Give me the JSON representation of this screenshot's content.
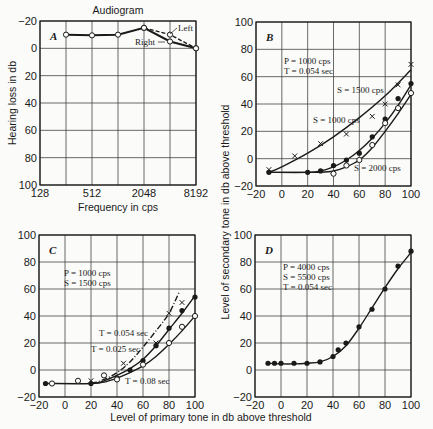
{
  "figure": {
    "shared_ylabel": "Level of secondary tone in db above threshold",
    "shared_xlabel": "Level of primary tone in db above threshold"
  },
  "chart_data": [
    {
      "id": "A",
      "type": "line",
      "title": "Audiogram",
      "panel_label": "A",
      "xlabel": "Frequency in cps",
      "ylabel": "Hearing loss in db",
      "x_scale": "log2",
      "x_ticks": [
        128,
        512,
        2048,
        8192
      ],
      "x_tick_labels": [
        "128",
        "512",
        "2048",
        "8192"
      ],
      "x_grid": [
        128,
        256,
        512,
        1024,
        2048,
        4096,
        8192
      ],
      "ylim": [
        -20,
        100
      ],
      "y_inverted": true,
      "y_ticks": [
        -20,
        0,
        20,
        40,
        60,
        80,
        100
      ],
      "y_tick_labels": [
        "−20",
        "0",
        "20",
        "40",
        "60",
        "80",
        "100"
      ],
      "grid": true,
      "series": [
        {
          "name": "Right",
          "style": "solid",
          "marker": "open-circle",
          "x": [
            256,
            512,
            1024,
            2048,
            4096,
            8192
          ],
          "y": [
            -10,
            -9.5,
            -10,
            -15,
            -5,
            0
          ]
        },
        {
          "name": "Left",
          "style": "dashed",
          "marker": "open-circle",
          "x": [
            2048,
            4096,
            8192
          ],
          "y": [
            -15,
            -10,
            0
          ]
        }
      ],
      "annotations": [
        {
          "text": "Left"
        },
        {
          "text": "Right"
        }
      ]
    },
    {
      "id": "B",
      "type": "scatter+line",
      "panel_label": "B",
      "xlim": [
        -20,
        100
      ],
      "ylim": [
        -20,
        100
      ],
      "x_ticks": [
        -20,
        0,
        20,
        40,
        60,
        80,
        100
      ],
      "y_ticks": [
        -20,
        0,
        20,
        40,
        60,
        80,
        100
      ],
      "grid": true,
      "conditions": [
        "P = 1000 cps",
        "T = 0.054 sec"
      ],
      "series": [
        {
          "name": "S = 1000 cps",
          "marker": "x",
          "x": [
            -10,
            10,
            30,
            50,
            70,
            80,
            90,
            100
          ],
          "y": [
            -8,
            2,
            11,
            18,
            31,
            40,
            54,
            69
          ]
        },
        {
          "name": "S = 1500 cps",
          "marker": "filled-circle",
          "x": [
            -10,
            20,
            30,
            40,
            50,
            60,
            70,
            80,
            90,
            100
          ],
          "y": [
            -10,
            -10,
            -9,
            -5,
            -1,
            4,
            16,
            29,
            44,
            55
          ]
        },
        {
          "name": "S = 2000 cps",
          "marker": "open-circle",
          "x": [
            40,
            50,
            60,
            70,
            80,
            90,
            100
          ],
          "y": [
            -11,
            -5,
            -1,
            10,
            26,
            37,
            48
          ]
        }
      ],
      "curves": [
        {
          "name": "S = 1000 cps",
          "x": [
            -10,
            0,
            20,
            40,
            60,
            80,
            100
          ],
          "y": [
            -10,
            -6,
            4,
            16,
            30,
            46,
            65
          ]
        },
        {
          "name": "S = 1500 cps",
          "x": [
            -10,
            20,
            30,
            40,
            50,
            60,
            70,
            80,
            90,
            100
          ],
          "y": [
            -10,
            -10,
            -9,
            -6,
            -1,
            6,
            15,
            26,
            39,
            54
          ]
        },
        {
          "name": "S = 2000 cps",
          "x": [
            -10,
            20,
            30,
            40,
            50,
            60,
            70,
            80,
            90,
            100
          ],
          "y": [
            -10,
            -10,
            -10,
            -9,
            -6,
            -1,
            8,
            20,
            33,
            47
          ]
        }
      ]
    },
    {
      "id": "C",
      "type": "scatter+line",
      "panel_label": "C",
      "xlim": [
        -20,
        100
      ],
      "ylim": [
        -20,
        100
      ],
      "x_ticks": [
        -20,
        0,
        20,
        40,
        60,
        80,
        100
      ],
      "y_ticks": [
        -20,
        0,
        20,
        40,
        60,
        80,
        100
      ],
      "grid": true,
      "conditions": [
        "P = 1000 cps",
        "S = 1500 cps"
      ],
      "series": [
        {
          "name": "T = 0.054 sec",
          "marker": "x",
          "x": [
            20,
            45,
            70,
            80,
            90
          ],
          "y": [
            -8,
            5,
            20,
            42,
            50
          ]
        },
        {
          "name": "T = 0.025 sec",
          "marker": "filled-circle",
          "x": [
            -15,
            20,
            40,
            50,
            60,
            70,
            80,
            90,
            100
          ],
          "y": [
            -10,
            -10,
            -6,
            0,
            7,
            18,
            31,
            44,
            54
          ]
        },
        {
          "name": "T = 0.08 sec",
          "marker": "open-circle",
          "x": [
            -10,
            10,
            30,
            40,
            60,
            80,
            90,
            100
          ],
          "y": [
            -10,
            -8,
            -4,
            -7,
            4,
            20,
            32,
            40
          ]
        }
      ],
      "curves": [
        {
          "name": "T = 0.054 sec",
          "style": "dash-dot",
          "x": [
            20,
            30,
            40,
            50,
            60,
            70,
            80,
            88
          ],
          "y": [
            -10,
            -7,
            -2,
            6,
            17,
            29,
            42,
            58
          ]
        },
        {
          "name": "T = 0.025 sec",
          "style": "solid",
          "x": [
            -15,
            20,
            30,
            40,
            50,
            60,
            70,
            80,
            90,
            100
          ],
          "y": [
            -10,
            -10,
            -8,
            -4,
            1,
            8,
            18,
            30,
            42,
            55
          ]
        },
        {
          "name": "T = 0.08 sec",
          "style": "solid",
          "x": [
            20,
            30,
            40,
            50,
            60,
            70,
            80,
            90,
            100
          ],
          "y": [
            -10,
            -9,
            -6,
            -2,
            3,
            10,
            19,
            29,
            40
          ]
        }
      ]
    },
    {
      "id": "D",
      "type": "scatter+line",
      "panel_label": "D",
      "xlim": [
        -20,
        100
      ],
      "ylim": [
        -20,
        100
      ],
      "x_ticks": [
        -20,
        0,
        20,
        40,
        60,
        80,
        100
      ],
      "y_ticks": [
        -20,
        0,
        20,
        40,
        60,
        80,
        100
      ],
      "grid": true,
      "conditions": [
        "P = 4000 cps",
        "S = 5500 cps",
        "T = 0.054 sec"
      ],
      "series": [
        {
          "name": "data",
          "marker": "filled-circle",
          "x": [
            -10,
            -5,
            0,
            10,
            20,
            30,
            40,
            44,
            50,
            60,
            70,
            80,
            90,
            100
          ],
          "y": [
            5,
            5,
            5,
            5,
            5,
            6,
            10,
            15,
            20,
            32,
            45,
            60,
            77,
            88
          ]
        }
      ],
      "curves": [
        {
          "name": "fit",
          "x": [
            -10,
            0,
            10,
            20,
            30,
            40,
            50,
            60,
            70,
            80,
            90,
            100
          ],
          "y": [
            5,
            4.5,
            4.5,
            5,
            6,
            10,
            18,
            31,
            46,
            61,
            75,
            87
          ]
        }
      ]
    }
  ],
  "labels": {
    "A_title": "Audiogram",
    "A_xlabel": "Frequency in cps",
    "A_ylabel": "Hearing loss in db",
    "A_left": "Left",
    "A_right": "Right",
    "B_cond1": "P = 1000 cps",
    "B_cond2": "T = 0.054 sec",
    "B_s1500": "S = 1500 cps",
    "B_s1000": "S = 1000 cps",
    "B_s2000": "S = 2000 cps",
    "C_cond1": "P = 1000 cps",
    "C_cond2": "S = 1500 cps",
    "C_t054": "T = 0.054 sec",
    "C_t025": "T = 0.025 sec",
    "C_t08": "T = 0.08 sec",
    "D_cond1": "P = 4000 cps",
    "D_cond2": "S = 5500 cps",
    "D_cond3": "T = 0.054 sec"
  }
}
